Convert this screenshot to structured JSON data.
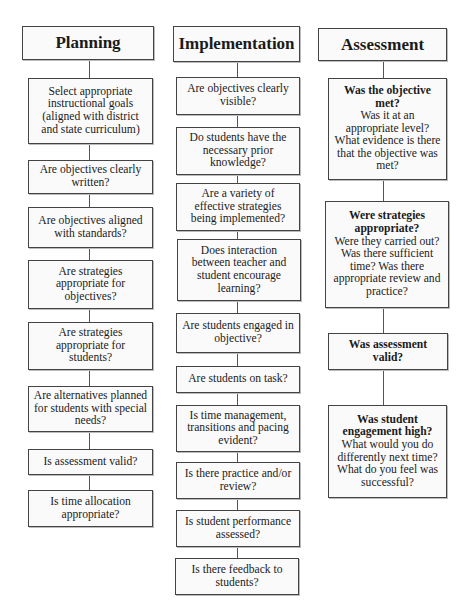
{
  "columns": [
    {
      "title": "Planning",
      "boxes": [
        {
          "text": "Select appropriate instructional goals (aligned with district and state curriculum)"
        },
        {
          "text": "Are objectives clearly written?"
        },
        {
          "text": "Are objectives aligned with standards?"
        },
        {
          "text": "Are strategies appropriate for objectives?"
        },
        {
          "text": "Are strategies appropriate for students?"
        },
        {
          "text": "Are alternatives planned for students with special needs?"
        },
        {
          "text": "Is assessment valid?"
        },
        {
          "text": "Is time allocation appropriate?"
        }
      ]
    },
    {
      "title": "Implementation",
      "boxes": [
        {
          "text": "Are objectives clearly visible?"
        },
        {
          "text": "Do students have the necessary prior knowledge?"
        },
        {
          "text": "Are a variety of effective strategies being implemented?"
        },
        {
          "text": "Does interaction between teacher and student encourage learning?"
        },
        {
          "text": "Are students engaged in objective?"
        },
        {
          "text": "Are students on task?"
        },
        {
          "text": "Is time management, transitions and pacing evident?"
        },
        {
          "text": "Is there practice and/or review?"
        },
        {
          "text": "Is student performance assessed?"
        },
        {
          "text": "Is there feedback to students?"
        }
      ]
    },
    {
      "title": "Assessment",
      "boxes": [
        {
          "heading": "Was the objective met?",
          "text": "Was it at an appropriate level? What evidence is there that the objective was met?"
        },
        {
          "heading": "Were strategies appropriate?",
          "text": "Were they carried out? Was there sufficient time? Was there appropriate review and practice?"
        },
        {
          "heading": "Was assessment valid?",
          "text": ""
        },
        {
          "heading": "Was student engagement high?",
          "text": "What would you do differently next time? What do you feel was successful?"
        }
      ]
    }
  ]
}
